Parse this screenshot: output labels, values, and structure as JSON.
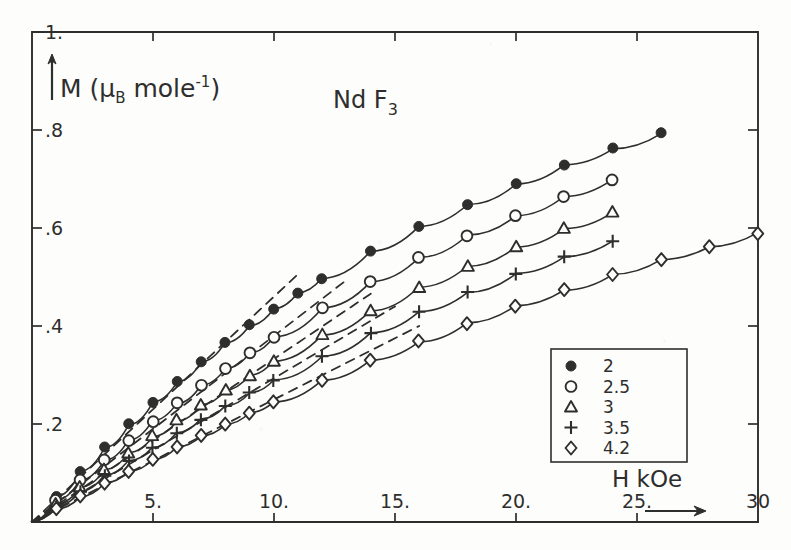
{
  "chart_data": {
    "type": "line",
    "title": "Nd F3",
    "title_display": "Nd F",
    "title_sub": "3",
    "xlabel": "H kOe",
    "ylabel": "M (μB mole-1)",
    "ylabel_main": "M (",
    "ylabel_mu": "μ",
    "ylabel_mu_sub": "B",
    "ylabel_mid": " mole",
    "ylabel_sup": "-1",
    "ylabel_close": ")",
    "xlim": [
      0,
      30
    ],
    "ylim": [
      0,
      1.0
    ],
    "xticks": [
      5,
      10,
      15,
      20,
      25,
      30
    ],
    "xticklabels": [
      "5.",
      "10.",
      "15.",
      "20.",
      "25.",
      "30"
    ],
    "yticks": [
      0.2,
      0.4,
      0.6,
      0.8,
      1.0
    ],
    "yticklabels": [
      ".2",
      ".4",
      ".6",
      ".8",
      "1."
    ],
    "grid": false,
    "legend_position": "lower-right",
    "legend_title": "",
    "units_note": "temperature in K",
    "series": [
      {
        "name": "2",
        "marker": "filled-circle",
        "x": [
          0,
          1,
          2,
          3,
          4,
          5,
          6,
          7,
          8,
          9,
          10,
          11,
          12,
          14,
          16,
          18,
          20,
          22,
          24,
          26
        ],
        "y": [
          0,
          0.052,
          0.103,
          0.152,
          0.199,
          0.244,
          0.287,
          0.327,
          0.365,
          0.401,
          0.435,
          0.467,
          0.497,
          0.552,
          0.602,
          0.648,
          0.69,
          0.728,
          0.762,
          0.793
        ],
        "dashed_tangent": {
          "x": [
            0,
            11
          ],
          "y": [
            0,
            0.506
          ]
        }
      },
      {
        "name": "2.5",
        "marker": "open-circle",
        "x": [
          0,
          1,
          2,
          3,
          4,
          5,
          6,
          7,
          8,
          9,
          10,
          12,
          14,
          16,
          18,
          20,
          22,
          24
        ],
        "y": [
          0,
          0.043,
          0.085,
          0.126,
          0.166,
          0.205,
          0.242,
          0.278,
          0.312,
          0.345,
          0.377,
          0.436,
          0.49,
          0.539,
          0.584,
          0.625,
          0.663,
          0.697
        ],
        "dashed_tangent": {
          "x": [
            0,
            13
          ],
          "y": [
            0,
            0.494
          ]
        }
      },
      {
        "name": "3",
        "marker": "open-triangle",
        "x": [
          0,
          1,
          2,
          3,
          4,
          5,
          6,
          7,
          8,
          9,
          10,
          12,
          14,
          16,
          18,
          20,
          22,
          24
        ],
        "y": [
          0,
          0.036,
          0.072,
          0.107,
          0.141,
          0.175,
          0.207,
          0.239,
          0.269,
          0.299,
          0.327,
          0.381,
          0.431,
          0.478,
          0.521,
          0.561,
          0.598,
          0.632
        ],
        "dashed_tangent": {
          "x": [
            0,
            14
          ],
          "y": [
            0,
            0.466
          ]
        }
      },
      {
        "name": "3.5",
        "marker": "plus",
        "x": [
          0,
          1,
          2,
          3,
          4,
          5,
          6,
          7,
          8,
          9,
          10,
          12,
          14,
          16,
          18,
          20,
          22,
          24
        ],
        "y": [
          0,
          0.031,
          0.062,
          0.093,
          0.123,
          0.152,
          0.181,
          0.209,
          0.236,
          0.263,
          0.289,
          0.338,
          0.385,
          0.428,
          0.468,
          0.506,
          0.541,
          0.573
        ],
        "dashed_tangent": {
          "x": [
            0,
            15
          ],
          "y": [
            0,
            0.44
          ]
        }
      },
      {
        "name": "4.2",
        "marker": "open-diamond",
        "x": [
          0,
          1,
          2,
          3,
          4,
          5,
          6,
          7,
          8,
          9,
          10,
          12,
          14,
          16,
          18,
          20,
          22,
          24,
          26,
          28,
          30
        ],
        "y": [
          0,
          0.026,
          0.052,
          0.078,
          0.103,
          0.128,
          0.152,
          0.176,
          0.199,
          0.222,
          0.245,
          0.288,
          0.329,
          0.368,
          0.405,
          0.44,
          0.473,
          0.504,
          0.534,
          0.562,
          0.589
        ],
        "dashed_tangent": {
          "x": [
            0,
            16
          ],
          "y": [
            0,
            0.4
          ]
        }
      }
    ]
  },
  "legend": {
    "entries": [
      {
        "marker": "filled-circle",
        "label": "2"
      },
      {
        "marker": "open-circle",
        "label": "2.5"
      },
      {
        "marker": "open-triangle",
        "label": "3"
      },
      {
        "marker": "plus",
        "label": "3.5"
      },
      {
        "marker": "open-diamond",
        "label": "4.2"
      }
    ]
  },
  "colors": {
    "ink": "#2e2e2e",
    "paper": "#fdfdfb"
  }
}
